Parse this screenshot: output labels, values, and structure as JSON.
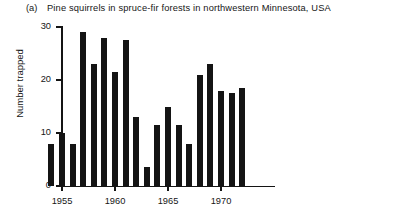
{
  "figure": {
    "panel_letter": "(a)",
    "title": "Pine squirrels in spruce-fir forests in northwestern Minnesota, USA"
  },
  "axes": {
    "y_label": "Number trapped",
    "y_ticks": [
      0,
      10,
      20,
      30
    ],
    "x_ticks": [
      1955,
      1960,
      1965,
      1970
    ]
  },
  "chart_data": {
    "type": "bar",
    "title": "Pine squirrels in spruce-fir forests in northwestern Minnesota, USA",
    "xlabel": "",
    "ylabel": "Number trapped",
    "categories": [
      1954,
      1955,
      1956,
      1957,
      1958,
      1959,
      1960,
      1961,
      1962,
      1963,
      1964,
      1965,
      1966,
      1967,
      1968,
      1969,
      1970,
      1971,
      1972,
      1973,
      1974
    ],
    "values": [
      8,
      10,
      8,
      29,
      23,
      28,
      21.5,
      27.5,
      13,
      3.5,
      11.5,
      15,
      11.5,
      8,
      21,
      23,
      18,
      17.5,
      18.5,
      null,
      null
    ],
    "xlim": [
      1953.5,
      1974.5
    ],
    "ylim": [
      0,
      30
    ],
    "grid": false,
    "legend": "none",
    "bar_color": "#141414"
  }
}
